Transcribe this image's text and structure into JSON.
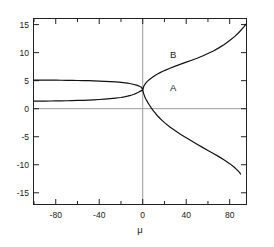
{
  "chart_data": {
    "type": "line",
    "title": "",
    "subtitle": "",
    "xlabel": "μ",
    "ylabel": "",
    "xlim": [
      -100,
      95
    ],
    "ylim": [
      -17,
      16
    ],
    "grid": false,
    "zero_lines": true,
    "legend_position": "inline-annotation",
    "xticks": [
      -100,
      -80,
      -60,
      -40,
      -20,
      0,
      20,
      40,
      60,
      80
    ],
    "xticklabels": [
      "",
      "-80",
      "",
      "-40",
      "",
      "0",
      "",
      "40",
      "",
      "80"
    ],
    "yticks": [
      -15,
      -10,
      -5,
      0,
      5,
      10,
      15
    ],
    "yticklabels": [
      "-15",
      "-10",
      "-5",
      "0",
      "5",
      "10",
      "15"
    ],
    "annotations": [
      {
        "text": "B",
        "x": 28,
        "y": 9.0
      },
      {
        "text": "A",
        "x": 28,
        "y": 3.2
      }
    ],
    "series": [
      {
        "name": "upper-branch-B",
        "label": "B",
        "color": "#111111",
        "points": [
          [
            -100,
            5.1
          ],
          [
            -95,
            5.1
          ],
          [
            -90,
            5.1
          ],
          [
            -85,
            5.09
          ],
          [
            -80,
            5.08
          ],
          [
            -75,
            5.07
          ],
          [
            -70,
            5.06
          ],
          [
            -65,
            5.05
          ],
          [
            -60,
            5.03
          ],
          [
            -55,
            5.01
          ],
          [
            -50,
            4.99
          ],
          [
            -45,
            4.96
          ],
          [
            -40,
            4.93
          ],
          [
            -35,
            4.89
          ],
          [
            -30,
            4.84
          ],
          [
            -25,
            4.78
          ],
          [
            -22,
            4.74
          ],
          [
            -20,
            4.7
          ],
          [
            -18,
            4.66
          ],
          [
            -16,
            4.61
          ],
          [
            -14,
            4.55
          ],
          [
            -12,
            4.49
          ],
          [
            -10,
            4.41
          ],
          [
            -8,
            4.32
          ],
          [
            -6,
            4.21
          ],
          [
            -5,
            4.15
          ],
          [
            -4,
            4.08
          ],
          [
            -3,
            4.0
          ],
          [
            -2,
            3.9
          ],
          [
            -1,
            3.78
          ],
          [
            0,
            3.3
          ],
          [
            1,
            4.0
          ],
          [
            2,
            4.35
          ],
          [
            3,
            4.6
          ],
          [
            4,
            4.82
          ],
          [
            5,
            5.0
          ],
          [
            6,
            5.18
          ],
          [
            8,
            5.48
          ],
          [
            10,
            5.75
          ],
          [
            12,
            6.0
          ],
          [
            14,
            6.22
          ],
          [
            16,
            6.43
          ],
          [
            18,
            6.62
          ],
          [
            20,
            6.8
          ],
          [
            25,
            7.22
          ],
          [
            30,
            7.6
          ],
          [
            35,
            7.95
          ],
          [
            40,
            8.3
          ],
          [
            45,
            8.65
          ],
          [
            50,
            9.0
          ],
          [
            55,
            9.4
          ],
          [
            60,
            9.85
          ],
          [
            65,
            10.3
          ],
          [
            70,
            10.85
          ],
          [
            75,
            11.45
          ],
          [
            80,
            12.15
          ],
          [
            85,
            12.95
          ],
          [
            88,
            13.5
          ],
          [
            91,
            14.15
          ],
          [
            93,
            14.6
          ],
          [
            95,
            15.1
          ]
        ]
      },
      {
        "name": "lower-branch-A",
        "label": "A",
        "color": "#111111",
        "points": [
          [
            -100,
            1.35
          ],
          [
            -95,
            1.35
          ],
          [
            -90,
            1.36
          ],
          [
            -85,
            1.37
          ],
          [
            -80,
            1.38
          ],
          [
            -75,
            1.4
          ],
          [
            -70,
            1.42
          ],
          [
            -65,
            1.44
          ],
          [
            -60,
            1.47
          ],
          [
            -55,
            1.5
          ],
          [
            -50,
            1.54
          ],
          [
            -45,
            1.59
          ],
          [
            -40,
            1.64
          ],
          [
            -35,
            1.7
          ],
          [
            -30,
            1.78
          ],
          [
            -25,
            1.88
          ],
          [
            -22,
            1.95
          ],
          [
            -20,
            2.0
          ],
          [
            -18,
            2.07
          ],
          [
            -16,
            2.14
          ],
          [
            -14,
            2.23
          ],
          [
            -12,
            2.33
          ],
          [
            -10,
            2.44
          ],
          [
            -8,
            2.58
          ],
          [
            -6,
            2.74
          ],
          [
            -5,
            2.83
          ],
          [
            -4,
            2.93
          ],
          [
            -3,
            3.04
          ],
          [
            -2,
            3.14
          ],
          [
            -1,
            3.22
          ],
          [
            0,
            3.3
          ],
          [
            1,
            2.6
          ],
          [
            2,
            2.1
          ],
          [
            3,
            1.7
          ],
          [
            4,
            1.35
          ],
          [
            5,
            1.0
          ],
          [
            6,
            0.7
          ],
          [
            8,
            0.1
          ],
          [
            10,
            -0.42
          ],
          [
            12,
            -0.9
          ],
          [
            14,
            -1.35
          ],
          [
            16,
            -1.75
          ],
          [
            18,
            -2.12
          ],
          [
            20,
            -2.48
          ],
          [
            25,
            -3.25
          ],
          [
            30,
            -3.95
          ],
          [
            35,
            -4.6
          ],
          [
            40,
            -5.2
          ],
          [
            45,
            -5.78
          ],
          [
            50,
            -6.35
          ],
          [
            55,
            -6.9
          ],
          [
            60,
            -7.45
          ],
          [
            65,
            -8.0
          ],
          [
            70,
            -8.55
          ],
          [
            75,
            -9.15
          ],
          [
            80,
            -9.8
          ],
          [
            84,
            -10.4
          ],
          [
            87,
            -10.95
          ],
          [
            89,
            -11.35
          ],
          [
            90,
            -11.65
          ]
        ]
      }
    ]
  }
}
